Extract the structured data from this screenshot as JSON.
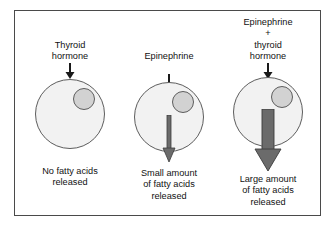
{
  "figure": {
    "frame_color": "#4a4a4a",
    "background": "#ffffff"
  },
  "colors": {
    "cell_fill": "#f2f2f2",
    "cell_stroke": "#5d5d5d",
    "nucleus_fill": "#d2d2d2",
    "nucleus_stroke": "#5d5d5d",
    "arrow_small": "#6b6b6b",
    "arrow_large": "#6b6b6b",
    "input_arrow": "#1a1a1a",
    "text": "#121212"
  },
  "panels": [
    {
      "id": "panel-1",
      "stimulus_label": "Thyroid\nhormone",
      "input_arrow_icon": "down-arrow-icon",
      "cell_icon": "cell-circle-icon",
      "nucleus_icon": "nucleus-icon",
      "release_arrow_size": "none",
      "release_arrow_icon": "no-release-arrow-icon",
      "caption": "No fatty acids\nreleased"
    },
    {
      "id": "panel-2",
      "stimulus_label": "Epinephrine",
      "input_arrow_icon": "down-arrow-icon",
      "cell_icon": "cell-circle-icon",
      "nucleus_icon": "nucleus-icon",
      "release_arrow_size": "small",
      "release_arrow_icon": "small-down-arrow-icon",
      "caption": "Small amount\nof fatty acids\nreleased"
    },
    {
      "id": "panel-3",
      "stimulus_label": "Epinephrine\n+\nthyroid\nhormone",
      "input_arrow_icon": "down-arrow-icon",
      "cell_icon": "cell-circle-icon",
      "nucleus_icon": "nucleus-icon",
      "release_arrow_size": "large",
      "release_arrow_icon": "large-down-arrow-icon",
      "caption": "Large amount\nof fatty acids\nreleased"
    }
  ]
}
